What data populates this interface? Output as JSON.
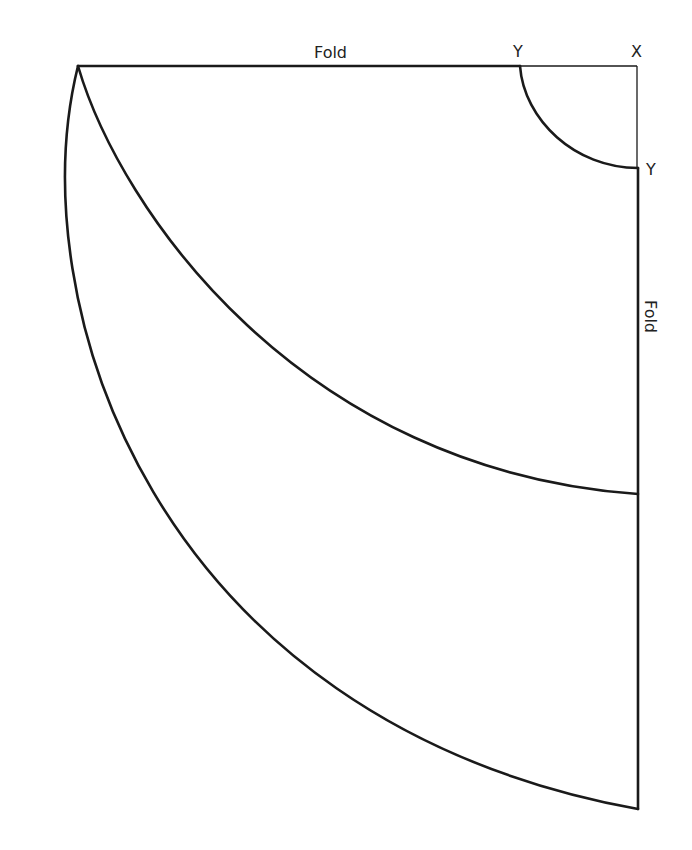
{
  "diagram": {
    "type": "sewing-pattern-skirt-quarter",
    "labels": {
      "top_fold": "Fold",
      "right_fold": "Fold",
      "corner": "X",
      "waist_top": "Y",
      "waist_right": "Y"
    },
    "colors": {
      "line": "#1a1a1a",
      "background": "#ffffff"
    }
  }
}
